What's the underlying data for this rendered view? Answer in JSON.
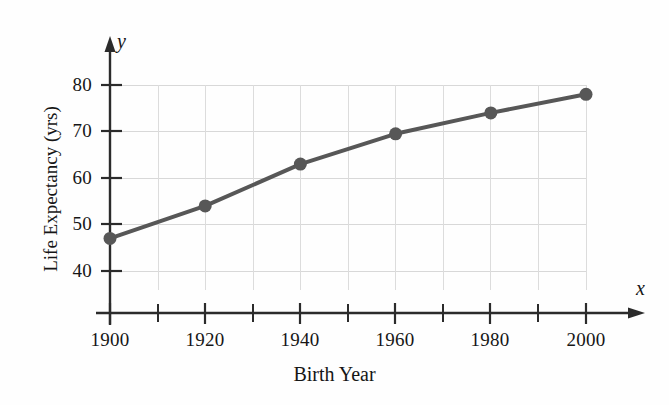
{
  "chart_data": {
    "type": "line",
    "title": "",
    "subtitle": "",
    "xlabel": "Birth Year",
    "ylabel": "Life Expectancy (yrs)",
    "x_axis_variable": "x",
    "y_axis_variable": "y",
    "x": [
      1900,
      1920,
      1940,
      1960,
      1980,
      2000
    ],
    "values": [
      47,
      54,
      63,
      69.5,
      74,
      78
    ],
    "series": [
      {
        "name": "Life Expectancy",
        "x": [
          1900,
          1920,
          1940,
          1960,
          1980,
          2000
        ],
        "values": [
          47,
          54,
          63,
          69.5,
          74,
          78
        ]
      }
    ],
    "xlim": [
      1900,
      2000
    ],
    "ylim": [
      35,
      83
    ],
    "x_major_ticks": [
      1900,
      1920,
      1940,
      1960,
      1980,
      2000
    ],
    "x_minor_ticks": [
      1910,
      1930,
      1950,
      1970,
      1990
    ],
    "x_tick_labels": [
      "1900",
      "1920",
      "1940",
      "1960",
      "1980",
      "2000"
    ],
    "y_major_ticks": [
      40,
      50,
      60,
      70,
      80
    ],
    "y_tick_labels": [
      "40",
      "50",
      "60",
      "70",
      "80"
    ],
    "grid": true,
    "grid_x": true,
    "grid_y": true,
    "legend": "none",
    "marker": "filled-circle",
    "series_color": "#575757",
    "grid_color": "#d4d4d4",
    "axis_color": "#2b2b2b",
    "background_color": "#ffffff",
    "annotations": []
  },
  "axis": {
    "y_title": "Life Expectancy (yrs)",
    "x_title": "Birth Year",
    "y_variable": "y",
    "x_variable": "x"
  },
  "ytick_labels": [
    "80",
    "70",
    "60",
    "50",
    "40"
  ],
  "xtick_labels": [
    "1900",
    "1920",
    "1940",
    "1960",
    "1980",
    "2000"
  ]
}
